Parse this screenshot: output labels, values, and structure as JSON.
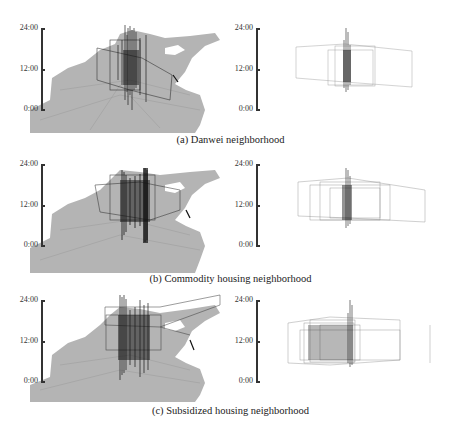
{
  "figure": {
    "rows": [
      {
        "caption": "(a) Danwei neighborhood",
        "left_panel": {
          "view": "space-time-map",
          "y_ticks": [
            "24:00",
            "12:00",
            "0:00"
          ]
        },
        "right_panel": {
          "view": "space-time-trajectories-only",
          "y_ticks": [
            "24:00",
            "12:00",
            "0:00"
          ]
        }
      },
      {
        "caption": "(b) Commodity housing neighborhood",
        "left_panel": {
          "view": "space-time-map",
          "y_ticks": [
            "24:00",
            "12:00",
            "0:00"
          ]
        },
        "right_panel": {
          "view": "space-time-trajectories-only",
          "y_ticks": [
            "24:00",
            "12:00",
            "0:00"
          ]
        }
      },
      {
        "caption": "(c) Subsidized housing neighborhood",
        "left_panel": {
          "view": "space-time-map",
          "y_ticks": [
            "24:00",
            "12:00",
            "0:00"
          ]
        },
        "right_panel": {
          "view": "space-time-trajectories-only",
          "y_ticks": [
            "24:00",
            "12:00",
            "0:00"
          ]
        }
      }
    ],
    "colors": {
      "map_fill": "#b4b4b4",
      "trajectory": "#1a1a1a",
      "axis": "#333333"
    }
  }
}
